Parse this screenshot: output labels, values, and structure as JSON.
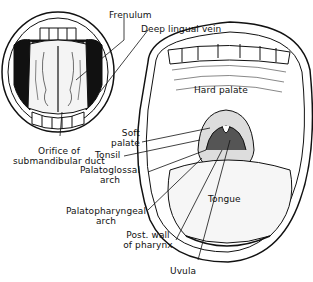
{
  "figure": {
    "title": "",
    "views": [
      {
        "name": "underside-of-tongue",
        "description": "Mouth open with tongue raised"
      },
      {
        "name": "open-mouth",
        "description": "Wide open mouth showing palate and pharynx"
      }
    ]
  },
  "labels": {
    "frenulum": "Frenulum",
    "deep_lingual_vein": "Deep lingual vein",
    "orifice_line1": "Orifice of",
    "orifice_line2": "submandibular duct",
    "hard_palate": "Hard palate",
    "soft_palate_line1": "Soft",
    "soft_palate_line2": "palate",
    "tonsil": "Tonsil",
    "palatoglossal_line1": "Palatoglossal",
    "palatoglossal_line2": "arch",
    "palatopharyngeal_line1": "Palatopharyngeal",
    "palatopharyngeal_line2": "arch",
    "tongue": "Tongue",
    "post_wall_line1": "Post. wall",
    "post_wall_line2": "of pharynx",
    "uvula": "Uvula"
  }
}
